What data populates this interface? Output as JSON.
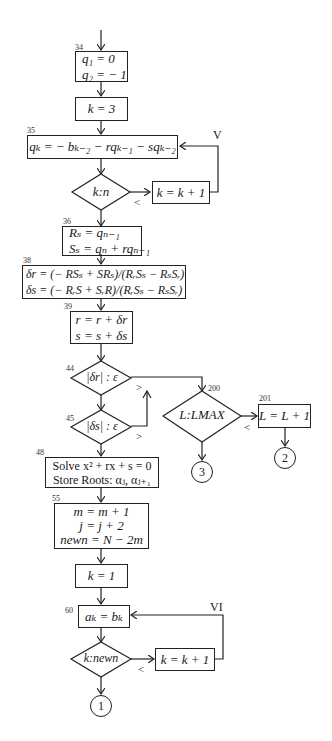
{
  "flowchart": {
    "nodes": {
      "n34": {
        "label": "34",
        "lines": [
          "q₁ = 0",
          "q₂ = − 1"
        ]
      },
      "k3": {
        "lines": [
          "k = 3"
        ]
      },
      "n35": {
        "label": "35",
        "text": "qₖ = − bₖ₋₂ − rqₖ₋₁ − sqₖ₋₂"
      },
      "d_kn": {
        "text": "k:n",
        "branch": "<"
      },
      "inc1": {
        "text": "k = k + 1"
      },
      "loop1": "V",
      "n36": {
        "label": "36",
        "lines": [
          "Rₛ = qₙ₋₁",
          "Sₛ = qₙ + rqₙ₋₁"
        ]
      },
      "n38": {
        "label": "38",
        "lines": [
          "δr = (− RSₛ + SRₛ)/(RᵣSₛ − RₛSᵣ)",
          "δs = (− RᵣS + SᵣR)/(RᵣSₛ − RₛSᵣ)"
        ]
      },
      "n39": {
        "label": "39",
        "lines": [
          "r = r + δr",
          "s = s + δs"
        ]
      },
      "d44": {
        "label": "44",
        "text": "|δr| : ε",
        "branch": ">"
      },
      "d45": {
        "label": "45",
        "text": "|δs| : ε",
        "branch": ">"
      },
      "d200": {
        "label": "200",
        "text": "L:LMAX",
        "branch": "<"
      },
      "n201": {
        "label": "201",
        "text": "L = L + 1"
      },
      "c2": "2",
      "c3": "3",
      "n48": {
        "label": "48",
        "lines": [
          "Solve x² + rx + s = 0",
          "Store Roots: αⱼ, αⱼ₊₁"
        ]
      },
      "n55": {
        "label": "55",
        "lines": [
          "m = m + 1",
          "j = j + 2",
          "newn = N − 2m"
        ]
      },
      "k1": {
        "lines": [
          "k = 1"
        ]
      },
      "n60": {
        "label": "60",
        "text": "aₖ = bₖ"
      },
      "d_newn": {
        "text": "k:newn",
        "branch": "<"
      },
      "inc2": {
        "text": "k = k + 1"
      },
      "loop2": "VI",
      "c1": "1"
    }
  }
}
